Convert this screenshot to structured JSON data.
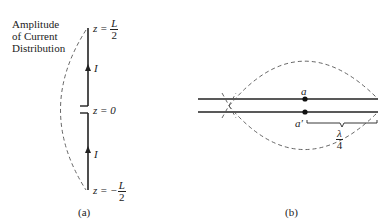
{
  "figure_a": {
    "caption": "(a)",
    "title_lines": [
      "Amplitude",
      "of Current",
      "Distribution"
    ],
    "top_label_prefix": "z = ",
    "top_label_num": "L",
    "top_label_den": "2",
    "mid_label": "z = 0",
    "bottom_label_prefix": "z = −",
    "bottom_label_num": "L",
    "bottom_label_den": "2",
    "current_label_upper": "I",
    "current_label_lower": "I"
  },
  "figure_b": {
    "caption": "(b)",
    "terminal_a": "a",
    "terminal_a_prime": "a′",
    "length_num": "λ",
    "length_den": "4"
  }
}
